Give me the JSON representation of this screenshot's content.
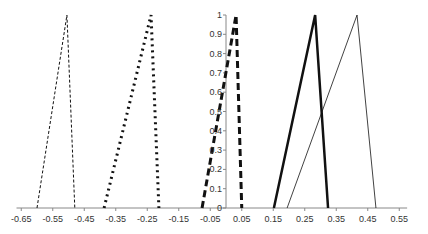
{
  "chart_data": {
    "type": "line",
    "title": "",
    "xlabel": "",
    "ylabel": "",
    "xlim": [
      -0.65,
      0.57
    ],
    "ylim": [
      0,
      1
    ],
    "grid": false,
    "legend": "none",
    "x_ticks": [
      "-0.65",
      "-0.55",
      "-0.45",
      "-0.35",
      "-0.25",
      "-0.15",
      "-0.05",
      "0.05",
      "0.15",
      "0.25",
      "0.35",
      "0.45",
      "0.55"
    ],
    "y_ticks": [
      "0",
      "0.1",
      "0.2",
      "0.3",
      "0.4",
      "0.5",
      "0.6",
      "0.7",
      "0.8",
      "0.9",
      "1"
    ],
    "series": [
      {
        "name": "thin-dashed",
        "style": "dashed",
        "width": 1,
        "x": [
          -0.6,
          -0.505,
          -0.48
        ],
        "y": [
          0,
          1,
          0
        ]
      },
      {
        "name": "dotted",
        "style": "dotted",
        "width": 3,
        "x": [
          -0.387,
          -0.238,
          -0.213
        ],
        "y": [
          0,
          1,
          0
        ]
      },
      {
        "name": "thick-dashed",
        "style": "dashed-thick",
        "width": 3,
        "x": [
          -0.076,
          0.032,
          0.05
        ],
        "y": [
          0,
          1,
          0
        ]
      },
      {
        "name": "thick-solid",
        "style": "solid",
        "width": 2.5,
        "x": [
          0.152,
          0.283,
          0.324
        ],
        "y": [
          0,
          1,
          0
        ]
      },
      {
        "name": "thin-solid",
        "style": "solid",
        "width": 0.8,
        "x": [
          0.194,
          0.416,
          0.476
        ],
        "y": [
          0,
          1,
          0
        ]
      }
    ]
  }
}
